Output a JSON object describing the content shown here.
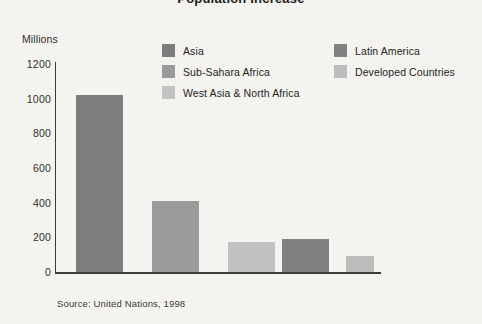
{
  "chart_data": {
    "type": "bar",
    "title": "Population Increase",
    "ylabel": "Millions",
    "xlabel": "",
    "ylim": [
      0,
      1200
    ],
    "yticks": [
      1200,
      1000,
      800,
      600,
      400,
      200,
      0
    ],
    "ytick_labels": [
      "1200",
      "1000",
      "800",
      "600",
      "400",
      "200",
      "0"
    ],
    "grid": false,
    "legend_position": "upper-center",
    "categories": [
      "Asia",
      "Sub-Sahara Africa",
      "West Asia & North Africa",
      "Latin America",
      "Developed Countries"
    ],
    "values": [
      1020,
      410,
      175,
      190,
      90
    ],
    "colors": [
      "#7d7d7d",
      "#9a9a9a",
      "#c2c2c2",
      "#808080",
      "#bdbdbd"
    ],
    "source": "Source: United Nations, 1998"
  },
  "legend": {
    "columns": [
      {
        "items": [
          {
            "label": "Asia",
            "color": "#7d7d7d"
          },
          {
            "label": "Sub-Sahara Africa",
            "color": "#9a9a9a"
          },
          {
            "label": "West Asia & North Africa",
            "color": "#c2c2c2"
          }
        ]
      },
      {
        "items": [
          {
            "label": "Latin America",
            "color": "#808080"
          },
          {
            "label": "Developed Countries",
            "color": "#bdbdbd"
          }
        ]
      }
    ]
  },
  "page": {
    "background": "#f4f3ef",
    "axis_color": "#3a3a3a"
  }
}
